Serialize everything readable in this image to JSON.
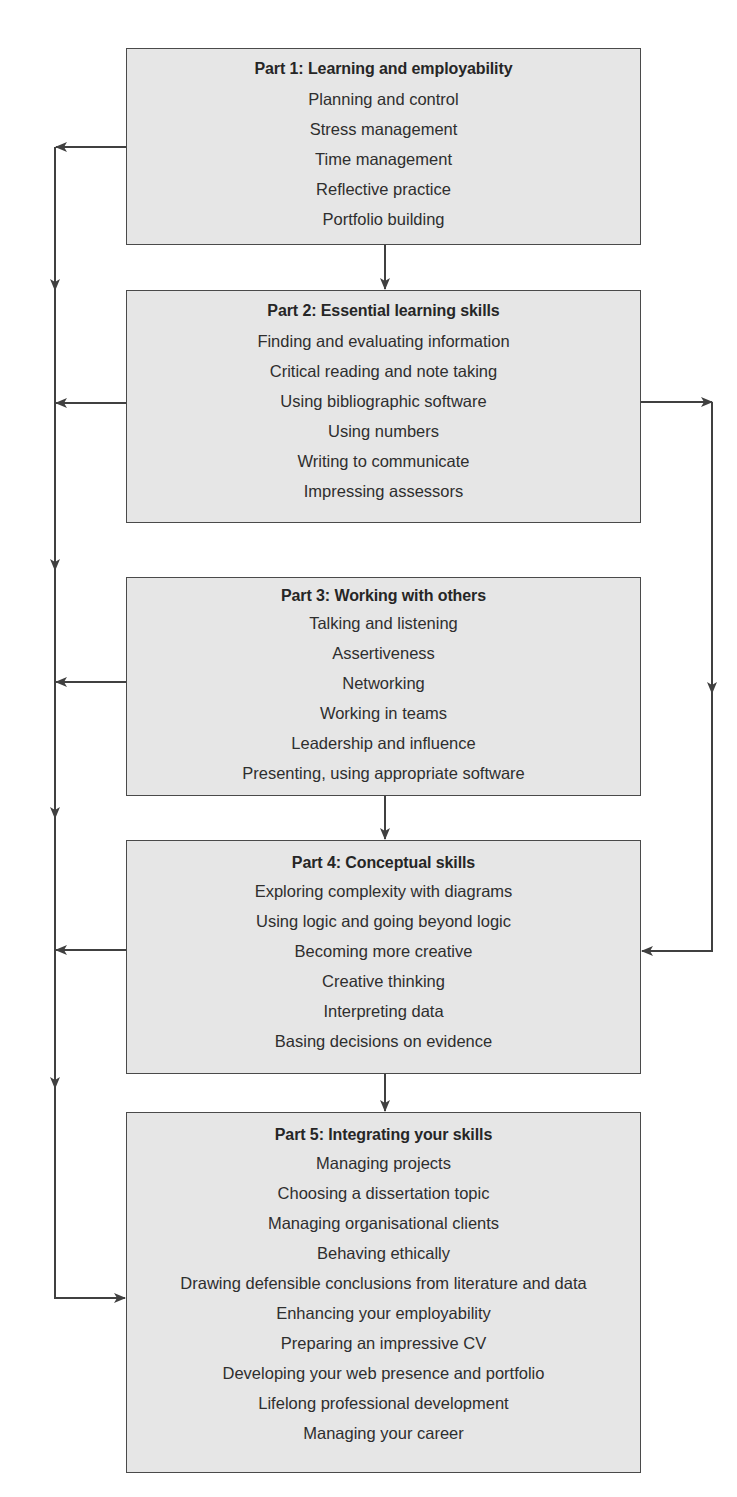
{
  "diagram": {
    "type": "flowchart",
    "parts": [
      {
        "title": "Part 1: Learning and employability",
        "items": [
          "Planning and control",
          "Stress management",
          "Time management",
          "Reflective practice",
          "Portfolio building"
        ]
      },
      {
        "title": "Part 2: Essential learning skills",
        "items": [
          "Finding and evaluating information",
          "Critical reading and note taking",
          "Using bibliographic software",
          "Using numbers",
          "Writing to communicate",
          "Impressing assessors"
        ]
      },
      {
        "title": "Part 3: Working with others",
        "items": [
          "Talking and listening",
          "Assertiveness",
          "Networking",
          "Working in teams",
          "Leadership and influence",
          "Presenting, using appropriate software"
        ]
      },
      {
        "title": "Part 4: Conceptual skills",
        "items": [
          "Exploring complexity with diagrams",
          "Using logic and going beyond logic",
          "Becoming more creative",
          "Creative thinking",
          "Interpreting data",
          "Basing decisions on evidence"
        ]
      },
      {
        "title": "Part 5: Integrating your skills",
        "items": [
          "Managing projects",
          "Choosing a dissertation topic",
          "Managing organisational clients",
          "Behaving ethically",
          "Drawing defensible conclusions from literature and data",
          "Enhancing your employability",
          "Preparing an impressive CV",
          "Developing your web presence and portfolio",
          "Lifelong professional development",
          "Managing your career"
        ]
      }
    ],
    "connections": [
      {
        "from": "Part 1",
        "to": "Part 2",
        "style": "direct"
      },
      {
        "from": "Part 3",
        "to": "Part 4",
        "style": "direct"
      },
      {
        "from": "Part 4",
        "to": "Part 5",
        "style": "direct"
      },
      {
        "from": "Part 2",
        "to": "Part 4",
        "style": "right-bypass"
      },
      {
        "from": "Part 1",
        "to": "Part 5",
        "style": "left-bus"
      },
      {
        "from": "Part 2",
        "to": "Part 5",
        "style": "left-bus"
      },
      {
        "from": "Part 3",
        "to": "Part 5",
        "style": "left-bus"
      },
      {
        "from": "Part 4",
        "to": "Part 5",
        "style": "left-bus"
      }
    ],
    "colors": {
      "box_fill": "#e6e6e6",
      "box_border": "#4a4a4a",
      "line": "#404040",
      "text": "#2b2b2b"
    }
  }
}
